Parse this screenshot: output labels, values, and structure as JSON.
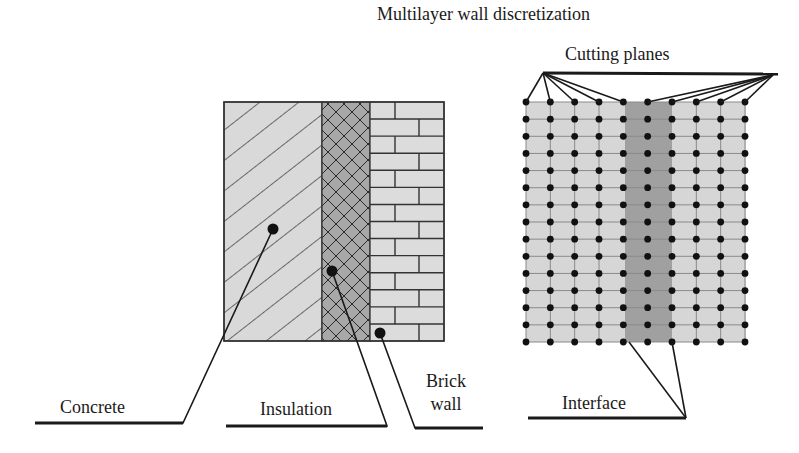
{
  "figure": {
    "title": "Multilayer wall discretization",
    "left_panel": {
      "layers": [
        {
          "name": "Concrete",
          "pattern": "diagonal-hatch",
          "fill": "#d9d9d9"
        },
        {
          "name": "Insulation",
          "pattern": "cross-hatch",
          "fill": "#a8a8a8"
        },
        {
          "name": "Brick wall",
          "pattern": "brick",
          "fill": "#dcdcdc"
        }
      ],
      "labels": {
        "concrete": "Concrete",
        "insulation": "Insulation",
        "brick_line1": "Brick",
        "brick_line2": "wall"
      }
    },
    "right_panel": {
      "cutting_planes_label": "Cutting planes",
      "interface_label": "Interface",
      "grid_columns": 10,
      "grid_rows": 15,
      "insulation_band_fill": "#a0a0a0",
      "mesh_fill": "#d6d6d6"
    },
    "colors": {
      "line": "#1a1a1a",
      "node": "#111111"
    }
  }
}
